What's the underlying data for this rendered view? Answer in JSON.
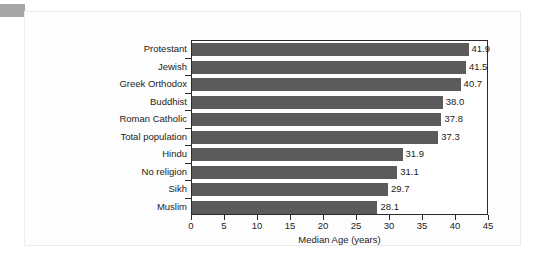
{
  "chart_data": {
    "type": "bar",
    "orientation": "horizontal",
    "title": "",
    "xlabel": "Median Age (years)",
    "ylabel": "",
    "xlim": [
      0,
      45
    ],
    "xticks": [
      "0",
      "5",
      "10",
      "15",
      "20",
      "25",
      "30",
      "35",
      "40",
      "45"
    ],
    "xtick_values": [
      0,
      5,
      10,
      15,
      20,
      25,
      30,
      35,
      40,
      45
    ],
    "grid": false,
    "legend": false,
    "bar_color": "#5b5b5b",
    "categories": [
      "Protestant",
      "Jewish",
      "Greek Orthodox",
      "Buddhist",
      "Roman Catholic",
      "Total population",
      "Hindu",
      "No religion",
      "Sikh",
      "Muslim"
    ],
    "values": [
      41.9,
      41.5,
      40.7,
      38.0,
      37.8,
      37.3,
      31.9,
      31.1,
      29.7,
      28.1
    ],
    "value_labels": [
      "41.9",
      "41.5",
      "40.7",
      "38.0",
      "37.8",
      "37.3",
      "31.9",
      "31.1",
      "29.7",
      "28.1"
    ]
  }
}
